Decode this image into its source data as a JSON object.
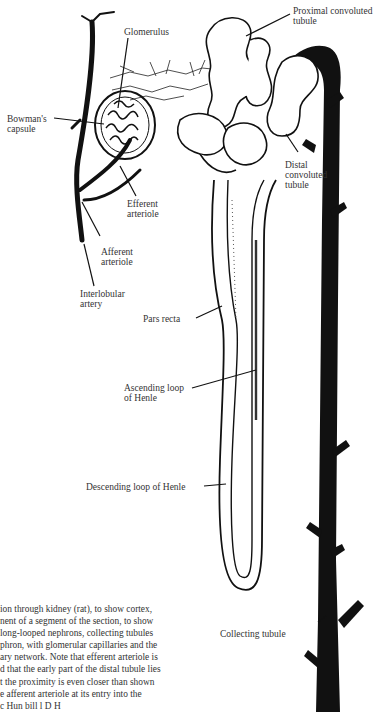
{
  "figure": {
    "labels": {
      "proximal_convoluted_tubule": [
        "Proximal convoluted",
        "tubule"
      ],
      "glomerulus": "Glomerulus",
      "bowmans_capsule": [
        "Bowman's",
        "capsule"
      ],
      "distal_convoluted_tubule": [
        "Distal",
        "convoluted",
        "tubule"
      ],
      "efferent_arteriole": [
        "Efferent",
        "arteriole"
      ],
      "afferent_arteriole": [
        "Afferent",
        "arteriole"
      ],
      "interlobular_artery": [
        "Interlobular",
        "artery"
      ],
      "pars_recta": "Pars recta",
      "ascending_loop": [
        "Ascending loop",
        "of Henle"
      ],
      "descending_loop": "Descending loop of Henle",
      "collecting_tubule": "Collecting tubule"
    },
    "caption_lines": [
      "ion through kidney (rat), to show cortex,",
      "nent of a segment of the section, to show",
      " long-looped nephrons, collecting tubules",
      "phron, with glomerular capillaries and the",
      "ary network. Note that efferent arteriole is",
      "d that the early part of the distal tubule lies",
      "t the proximity is even closer than shown",
      "e afferent arteriole at its entry into the",
      "                             c     Hun  bill     l  D  H"
    ]
  }
}
